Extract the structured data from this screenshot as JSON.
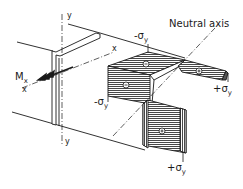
{
  "diagram": {
    "type": "engineering stress distribution in Z-section beam under bending",
    "labels": {
      "neutral_axis": "Neutral axis",
      "moment": {
        "symbol": "M",
        "subscript": "x"
      },
      "x_axis_left": "x",
      "x_axis_right": "x",
      "y_axis_top": "y",
      "y_axis_bottom": "y",
      "stress_top": {
        "sign": "-",
        "symbol": "σ",
        "subscript": "y"
      },
      "stress_left": {
        "sign": "-",
        "symbol": "σ",
        "subscript": "y"
      },
      "stress_right": {
        "sign": "+",
        "symbol": "σ",
        "subscript": "y"
      },
      "stress_bottom": {
        "sign": "+",
        "symbol": "σ",
        "subscript": "y"
      }
    },
    "zones": [
      {
        "id": "top-flange-left",
        "sign": "−"
      },
      {
        "id": "web-upper",
        "sign": "−"
      },
      {
        "id": "top-flange-right",
        "sign": "+"
      },
      {
        "id": "web-lower",
        "sign": "+"
      }
    ],
    "colors": {
      "line": "#1a1a1a",
      "hatch": "#333333",
      "background": "#ffffff"
    }
  }
}
